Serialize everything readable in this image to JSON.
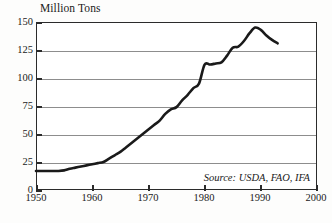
{
  "chart_data": {
    "type": "line",
    "title": "",
    "ylabel": "Million Tons",
    "xlabel": "",
    "ylim": [
      0,
      150
    ],
    "xlim": [
      1950,
      2000
    ],
    "grid": true,
    "legend": null,
    "yticks": [
      0,
      25,
      50,
      75,
      100,
      125,
      150
    ],
    "ytick_labels": [
      "0",
      "25",
      "50",
      "75",
      "100",
      "125",
      "150"
    ],
    "xticks": [
      1950,
      1960,
      1970,
      1980,
      1990,
      2000
    ],
    "xtick_labels": [
      "1950",
      "1960",
      "1970",
      "1980",
      "1990",
      "2000"
    ],
    "annotations": [
      {
        "name": "source",
        "text": "Source: USDA, FAO, IFA"
      }
    ],
    "series": [
      {
        "name": "World Fertilizer Use",
        "color": "#1a1a1a",
        "x": [
          1950,
          1951,
          1952,
          1953,
          1954,
          1955,
          1956,
          1957,
          1958,
          1959,
          1960,
          1961,
          1962,
          1963,
          1964,
          1965,
          1966,
          1967,
          1968,
          1969,
          1970,
          1971,
          1972,
          1973,
          1974,
          1975,
          1976,
          1977,
          1978,
          1979,
          1980,
          1981,
          1982,
          1983,
          1984,
          1985,
          1986,
          1987,
          1988,
          1989,
          1990,
          1991,
          1992,
          1993
        ],
        "y": [
          17,
          17,
          17,
          17,
          17,
          17.5,
          19,
          20,
          21,
          22,
          23,
          24,
          25,
          28,
          31,
          34,
          38,
          42,
          46,
          50,
          54,
          58,
          62,
          68,
          72,
          74,
          80,
          85,
          91,
          95,
          112,
          112,
          113,
          114,
          120,
          127,
          128,
          133,
          140,
          145,
          143,
          138,
          134,
          131
        ],
        "units": "million tons"
      }
    ]
  }
}
